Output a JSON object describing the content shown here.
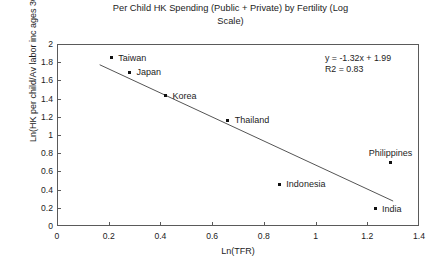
{
  "chart_data": {
    "type": "scatter",
    "title": "Per Child HK Spending (Public + Private) by Fertility (Log\nScale)",
    "xlabel": "Ln(TFR)",
    "ylabel": "Ln(HK per child/Av labor inc ages 30-49)",
    "xlim": [
      0,
      1.4
    ],
    "ylim": [
      0,
      2
    ],
    "grid": false,
    "legend": "none",
    "xticks": [
      "0",
      "0.2",
      "0.4",
      "0.6",
      "0.8",
      "1",
      "1.2",
      "1.4"
    ],
    "xtick_values": [
      0,
      0.2,
      0.4,
      0.6,
      0.8,
      1,
      1.2,
      1.4
    ],
    "yticks": [
      "0",
      "0.2",
      "0.4",
      "0.6",
      "0.8",
      "1",
      "1.2",
      "1.4",
      "1.6",
      "1.8",
      "2"
    ],
    "ytick_values": [
      0,
      0.2,
      0.4,
      0.6,
      0.8,
      1,
      1.2,
      1.4,
      1.6,
      1.8,
      2
    ],
    "points": [
      {
        "label": "Taiwan",
        "x": 0.21,
        "y": 1.85,
        "label_pos": "right"
      },
      {
        "label": "Japan",
        "x": 0.28,
        "y": 1.69,
        "label_pos": "right"
      },
      {
        "label": "Korea",
        "x": 0.42,
        "y": 1.43,
        "label_pos": "right"
      },
      {
        "label": "Thailand",
        "x": 0.66,
        "y": 1.16,
        "label_pos": "right"
      },
      {
        "label": "Indonesia",
        "x": 0.86,
        "y": 0.46,
        "label_pos": "right"
      },
      {
        "label": "Philippines",
        "x": 1.29,
        "y": 0.7,
        "label_pos": "above"
      },
      {
        "label": "India",
        "x": 1.23,
        "y": 0.19,
        "label_pos": "right"
      }
    ],
    "trendline": {
      "slope": -1.32,
      "intercept": 1.99,
      "x_start": 0.165,
      "x_end": 1.3,
      "equation_text": "y = -1.32x + 1.99\nR2 = 0.83",
      "equation_line1": "y = -1.32x + 1.99",
      "equation_line2": "R2 = 0.83"
    },
    "colors": {
      "marker": "#111111",
      "trendline": "#555555",
      "axis": "#5a5a5a",
      "text": "#1c1c1c",
      "background": "#ffffff"
    }
  }
}
